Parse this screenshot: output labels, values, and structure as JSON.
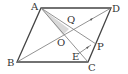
{
  "diagram": {
    "type": "geometry",
    "points": {
      "A": {
        "label": "A",
        "x": 41,
        "y": 8
      },
      "B": {
        "label": "B",
        "x": 17,
        "y": 62
      },
      "C": {
        "label": "C",
        "x": 88,
        "y": 62
      },
      "D": {
        "label": "D",
        "x": 111,
        "y": 8
      },
      "O": {
        "label": "O",
        "x": 64,
        "y": 35
      },
      "Q": {
        "label": "Q",
        "x": 71,
        "y": 28
      },
      "P": {
        "label": "P",
        "x": 96,
        "y": 44
      },
      "E": {
        "label": "E",
        "x": 78,
        "y": 53
      }
    },
    "shaded_region": [
      "A",
      "Q",
      "O"
    ],
    "colors": {
      "line": "#444444",
      "thin_line": "#777777",
      "shade": "#d9d9d9"
    }
  }
}
